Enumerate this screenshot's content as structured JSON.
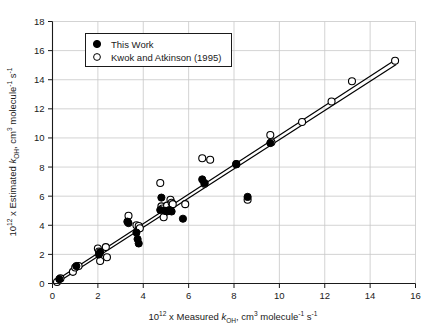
{
  "figure": {
    "background_color": "#ffffff",
    "frame_color": "#1a1a1a"
  },
  "chart_data": {
    "type": "scatter",
    "title": "",
    "xlabel_parts": {
      "prefix": "10",
      "exp": "12",
      "mid": " x Measured ",
      "k": "k",
      "ksub": "OH",
      "units_a": ", cm",
      "units_a_sup": "3",
      "units_b": " molecule",
      "units_b_sup": "-1",
      "units_c": " s",
      "units_c_sup": "-1"
    },
    "ylabel_parts": {
      "prefix": "10",
      "exp": "12",
      "mid": " x Estimated ",
      "k": "k",
      "ksub": "OH",
      "units_a": ", cm",
      "units_a_sup": "3",
      "units_b": " molecule",
      "units_b_sup": "-1",
      "units_c": " s",
      "units_c_sup": "-1"
    },
    "xlabel": "10^12 x Measured k_OH, cm^3 molecule^-1 s^-1",
    "ylabel": "10^12 x Estimated k_OH, cm^3 molecule^-1 s^-1",
    "xlim": [
      0,
      16
    ],
    "ylim": [
      0,
      18
    ],
    "xticks": [
      0,
      2,
      4,
      6,
      8,
      10,
      12,
      14,
      16
    ],
    "yticks": [
      0,
      2,
      4,
      6,
      8,
      10,
      12,
      14,
      16,
      18
    ],
    "grid": true,
    "grid_color": "#c8c8c8",
    "legend_position": "upper-left",
    "series": [
      {
        "name": "This Work",
        "marker": "filled-circle",
        "color": "#000000",
        "points": [
          [
            0.3,
            0.3
          ],
          [
            1.05,
            1.2
          ],
          [
            2.05,
            2.0
          ],
          [
            2.1,
            2.15
          ],
          [
            3.3,
            4.25
          ],
          [
            3.35,
            4.15
          ],
          [
            3.7,
            3.5
          ],
          [
            3.75,
            3.05
          ],
          [
            3.8,
            2.75
          ],
          [
            4.75,
            5.05
          ],
          [
            4.8,
            5.9
          ],
          [
            4.95,
            5.0
          ],
          [
            5.05,
            4.95
          ],
          [
            5.15,
            5.05
          ],
          [
            5.2,
            5.0
          ],
          [
            5.25,
            4.95
          ],
          [
            5.75,
            4.45
          ],
          [
            6.6,
            7.15
          ],
          [
            6.7,
            6.9
          ],
          [
            8.1,
            8.2
          ],
          [
            8.6,
            5.95
          ],
          [
            9.6,
            9.65
          ]
        ]
      },
      {
        "name": "Kwok and Atkinson (1995)",
        "marker": "open-circle",
        "color": "#000000",
        "points": [
          [
            0.2,
            0.1
          ],
          [
            0.35,
            0.35
          ],
          [
            0.9,
            0.8
          ],
          [
            1.0,
            1.1
          ],
          [
            1.15,
            1.2
          ],
          [
            2.0,
            2.4
          ],
          [
            2.05,
            2.2
          ],
          [
            2.1,
            1.55
          ],
          [
            2.35,
            2.5
          ],
          [
            2.4,
            1.8
          ],
          [
            3.35,
            4.65
          ],
          [
            3.7,
            4.0
          ],
          [
            3.8,
            3.95
          ],
          [
            3.85,
            3.8
          ],
          [
            4.75,
            6.9
          ],
          [
            4.8,
            5.3
          ],
          [
            4.85,
            5.15
          ],
          [
            4.9,
            4.55
          ],
          [
            5.05,
            5.35
          ],
          [
            5.2,
            5.75
          ],
          [
            5.25,
            5.55
          ],
          [
            5.3,
            5.45
          ],
          [
            5.85,
            5.45
          ],
          [
            6.6,
            8.6
          ],
          [
            6.95,
            8.5
          ],
          [
            6.7,
            6.85
          ],
          [
            8.1,
            8.2
          ],
          [
            8.6,
            5.75
          ],
          [
            9.6,
            10.2
          ],
          [
            9.65,
            9.7
          ],
          [
            11.0,
            11.1
          ],
          [
            12.3,
            12.5
          ],
          [
            13.2,
            13.9
          ],
          [
            15.1,
            15.3
          ]
        ]
      }
    ],
    "fit_lines": [
      {
        "name": "upper-fit-line",
        "x": [
          0.15,
          15.15
        ],
        "y": [
          0.2,
          15.4
        ]
      },
      {
        "name": "lower-fit-line",
        "x": [
          0.15,
          15.15
        ],
        "y": [
          0.0,
          15.05
        ]
      }
    ]
  },
  "legend": {
    "entries": [
      {
        "label": "This Work",
        "marker": "filled-circle"
      },
      {
        "label": "Kwok and Atkinson (1995)",
        "marker": "open-circle"
      }
    ]
  }
}
